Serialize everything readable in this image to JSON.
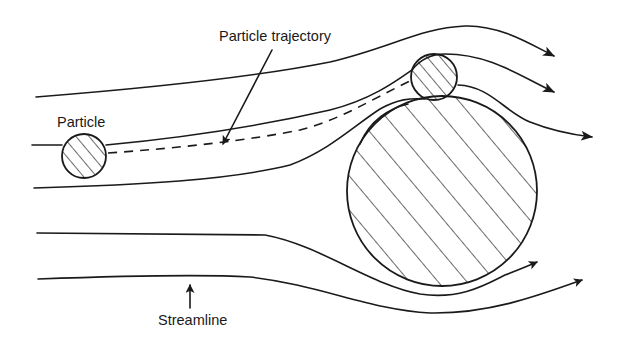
{
  "diagram": {
    "type": "flow-around-obstacle",
    "labels": {
      "particle_trajectory": "Particle trajectory",
      "particle": "Particle",
      "streamline": "Streamline"
    },
    "elements": {
      "collector": {
        "shape": "circle",
        "fill": "hatched",
        "cx": 442,
        "cy": 191,
        "r": 95
      },
      "particle_start": {
        "shape": "circle",
        "fill": "hatched",
        "cx": 84,
        "cy": 156,
        "r": 22
      },
      "particle_impact": {
        "shape": "circle",
        "fill": "hatched",
        "cx": 434,
        "cy": 77,
        "r": 23
      },
      "streamlines_count": 5,
      "trajectory_style": "dashed"
    },
    "colors": {
      "line": "#1a1a1a",
      "background": "#ffffff"
    }
  }
}
